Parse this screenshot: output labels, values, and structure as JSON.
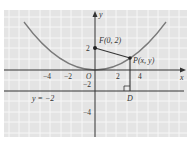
{
  "figure": {
    "colors": {
      "panel_bg": "#e4e4e4",
      "grid": "#f7f7f7",
      "axis": "#333333",
      "curve": "#7a7a7a",
      "segment": "#333333",
      "label": "#333333"
    },
    "axes": {
      "x_label": "x",
      "y_label": "y",
      "x_ticks": [
        {
          "label": "−4",
          "value": -4
        },
        {
          "label": "−2",
          "value": -2
        },
        {
          "label": "O",
          "value": 0
        },
        {
          "label": "2",
          "value": 2
        },
        {
          "label": "4",
          "value": 4
        }
      ],
      "y_ticks": [
        {
          "label": "2",
          "value": 2
        },
        {
          "label": "−2",
          "value": -2
        },
        {
          "label": "−4",
          "value": -4
        }
      ]
    },
    "labels": {
      "focus": "F(0, 2)",
      "point": "P(x, y)",
      "foot": "D",
      "directrix": "y = −2"
    },
    "points": {
      "focus": {
        "x": 0,
        "y": 2
      },
      "point_p": {
        "x": 3.4,
        "y": 1.0
      },
      "point_d": {
        "x": 3.4,
        "y": -2
      }
    },
    "curve": {
      "equation": "x^2 = 8y",
      "type": "parabola"
    },
    "directrix": {
      "y": -2
    }
  }
}
